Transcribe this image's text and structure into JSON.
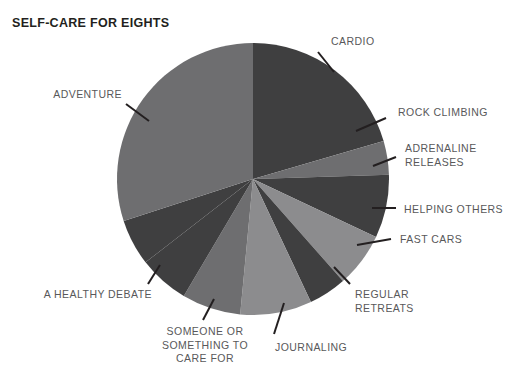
{
  "title": "SELF-CARE FOR EIGHTS",
  "palette": {
    "background": "#ffffff",
    "title_color": "#231f20",
    "label_color": "#58585a",
    "leader_color": "#231f20",
    "dark": "#3f3f40",
    "medium": "#6e6e70",
    "light": "#8c8c8e"
  },
  "chart_data": {
    "type": "pie",
    "title": "SELF-CARE FOR EIGHTS",
    "xlabel": "",
    "ylabel": "",
    "legend_position": "none",
    "grid": false,
    "start_angle_deg": 0,
    "direction": "clockwise",
    "center": {
      "x": 253,
      "y": 179
    },
    "radius": 136,
    "categories": [
      "CARDIO",
      "ROCK CLIMBING",
      "ADRENALINE RELEASES",
      "HELPING OTHERS",
      "FAST CARS",
      "REGULAR RETREATS",
      "JOURNALING",
      "SOMEONE OR SOMETHING TO CARE FOR",
      "A HEALTHY DEBATE",
      "ADVENTURE"
    ],
    "values": [
      20.5,
      4.0,
      7.5,
      6.5,
      4.5,
      8.5,
      7.0,
      6.0,
      5.5,
      30.0
    ],
    "slices": [
      {
        "label": "CARDIO",
        "label_lines": [
          "CARDIO"
        ],
        "value": 20.5,
        "color": "#3f3f40",
        "start_deg": 0,
        "end_deg": 73.8,
        "label_x": 331,
        "label_y": 35,
        "align": "start",
        "leader": {
          "x1": 318,
          "y1": 52,
          "x2": 334,
          "y2": 72
        }
      },
      {
        "label": "ROCK CLIMBING",
        "label_lines": [
          "ROCK CLIMBING"
        ],
        "value": 4.0,
        "color": "#6e6e70",
        "start_deg": 73.8,
        "end_deg": 88.2,
        "label_x": 398,
        "label_y": 106,
        "align": "start",
        "leader": {
          "x1": 356,
          "y1": 131,
          "x2": 386,
          "y2": 118
        }
      },
      {
        "label": "ADRENALINE RELEASES",
        "label_lines": [
          "ADRENALINE",
          "RELEASES"
        ],
        "value": 7.5,
        "color": "#3f3f40",
        "start_deg": 88.2,
        "end_deg": 115.2,
        "label_x": 405,
        "label_y": 142,
        "align": "start",
        "leader": {
          "x1": 373,
          "y1": 166,
          "x2": 396,
          "y2": 157
        }
      },
      {
        "label": "HELPING OTHERS",
        "label_lines": [
          "HELPING OTHERS"
        ],
        "value": 6.5,
        "color": "#8c8c8e",
        "start_deg": 115.2,
        "end_deg": 138.6,
        "label_x": 404,
        "label_y": 203,
        "align": "start",
        "leader": {
          "x1": 372,
          "y1": 208,
          "x2": 396,
          "y2": 208
        }
      },
      {
        "label": "FAST CARS",
        "label_lines": [
          "FAST CARS"
        ],
        "value": 4.5,
        "color": "#3f3f40",
        "start_deg": 138.6,
        "end_deg": 154.8,
        "label_x": 400,
        "label_y": 233,
        "align": "start",
        "leader": {
          "x1": 357,
          "y1": 245,
          "x2": 391,
          "y2": 239
        }
      },
      {
        "label": "REGULAR RETREATS",
        "label_lines": [
          "REGULAR",
          "RETREATS"
        ],
        "value": 8.5,
        "color": "#8c8c8e",
        "start_deg": 154.8,
        "end_deg": 185.4,
        "label_x": 355,
        "label_y": 288,
        "align": "start",
        "leader": {
          "x1": 334,
          "y1": 267,
          "x2": 350,
          "y2": 284
        }
      },
      {
        "label": "JOURNALING",
        "label_lines": [
          "JOURNALING"
        ],
        "value": 7.0,
        "color": "#6e6e70",
        "start_deg": 185.4,
        "end_deg": 210.6,
        "label_x": 275,
        "label_y": 341,
        "align": "start",
        "leader": {
          "x1": 284,
          "y1": 303,
          "x2": 274,
          "y2": 334
        }
      },
      {
        "label": "SOMEONE OR SOMETHING TO CARE FOR",
        "label_lines": [
          "SOMEONE OR",
          "SOMETHING TO",
          "CARE FOR"
        ],
        "value": 6.0,
        "color": "#3f3f40",
        "start_deg": 210.6,
        "end_deg": 232.2,
        "label_x": 205,
        "label_y": 325,
        "align": "mid",
        "leader": {
          "x1": 214,
          "y1": 299,
          "x2": 203,
          "y2": 320
        }
      },
      {
        "label": "A HEALTHY DEBATE",
        "label_lines": [
          "A HEALTHY DEBATE"
        ],
        "value": 5.5,
        "color": "#3f3f40",
        "start_deg": 232.2,
        "end_deg": 252.0,
        "label_x": 152,
        "label_y": 288,
        "align": "end",
        "leader": {
          "x1": 160,
          "y1": 265,
          "x2": 148,
          "y2": 284
        }
      },
      {
        "label": "ADVENTURE",
        "label_lines": [
          "ADVENTURE"
        ],
        "value": 30.0,
        "color": "#6e6e70",
        "start_deg": 252.0,
        "end_deg": 360.0,
        "label_x": 122,
        "label_y": 88,
        "align": "end",
        "leader": {
          "x1": 149,
          "y1": 121,
          "x2": 126,
          "y2": 104
        }
      }
    ]
  }
}
